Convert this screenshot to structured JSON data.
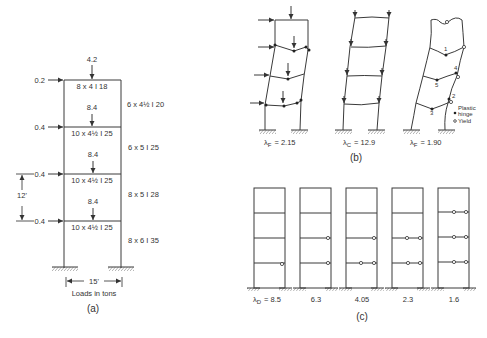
{
  "panel_a": {
    "caption": "(a)",
    "roof_load": "4.2",
    "floor_loads": [
      "8.4",
      "8.4",
      "8.4"
    ],
    "lateral_loads": [
      "0.2",
      "0.4",
      "0.4",
      "0.4"
    ],
    "beam_sections": [
      "8 x 4  I 18",
      "10 x 4½ I 25",
      "10 x 4½ I 25",
      "10 x 4½ I 25"
    ],
    "column_sections": [
      "6 x 4½ I 20",
      "6 x 5  I 25",
      "8 x 5  I 28",
      "8 x 6  I 35"
    ],
    "story_height": "12'",
    "bay_width": "15'",
    "units_note": "Loads in tons"
  },
  "panel_b": {
    "caption": "(b)",
    "frames": [
      {
        "label": "λF = 2.15",
        "lambda_sym": "λ",
        "lambda_sub": "F",
        "lambda_val": "= 2.15"
      },
      {
        "label": "λC = 12.9",
        "lambda_sym": "λ",
        "lambda_sub": "C",
        "lambda_val": "= 12.9"
      },
      {
        "label": "λF = 1.90",
        "lambda_sym": "λ",
        "lambda_sub": "F",
        "lambda_val": "= 1.90"
      }
    ],
    "hinge_numbers": [
      "1",
      "2",
      "3",
      "4",
      "5"
    ],
    "legend": {
      "plastic_hinge_1": "Plastic",
      "plastic_hinge_2": "hinge",
      "yield": "Yield"
    }
  },
  "panel_c": {
    "caption": "(c)",
    "lambda_prefix_sym": "λ",
    "lambda_prefix_sub": "D",
    "values": [
      "= 8.5",
      "6.3",
      "4.05",
      "2.3",
      "1.6"
    ]
  }
}
